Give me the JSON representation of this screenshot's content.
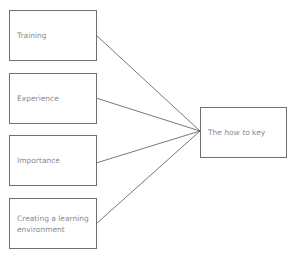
{
  "diagram": {
    "inputs": [
      {
        "label": "Training"
      },
      {
        "label": "Experience"
      },
      {
        "label": "Importance"
      },
      {
        "label": "Creating a learning environment"
      }
    ],
    "output": {
      "prefix": "The ",
      "emphasis": "how to",
      "suffix": " key"
    },
    "colors": {
      "border": "#6f6f6f",
      "text": "#8a8a8a",
      "line": "#555555"
    }
  }
}
